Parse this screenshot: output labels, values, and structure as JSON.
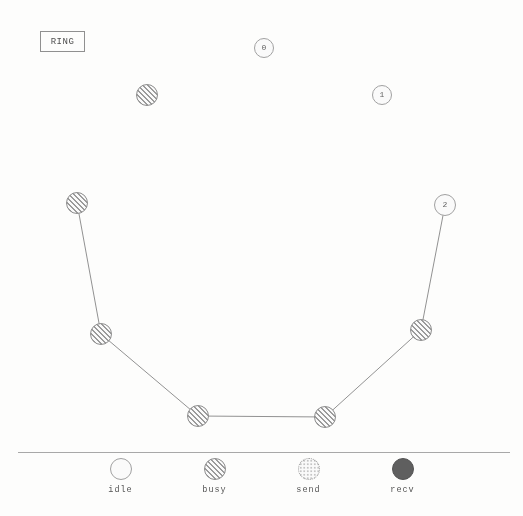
{
  "window": {
    "title_label": "RING",
    "background_color": "#fdfdfc",
    "ink_color": "#5c5c5c"
  },
  "diagram": {
    "edge_color": "#909090",
    "nodes": [
      {
        "id": "n0",
        "label": "0",
        "state": "idle",
        "x": 264,
        "y": 48,
        "r": 10
      },
      {
        "id": "n1",
        "label": "1",
        "state": "idle",
        "x": 382,
        "y": 95,
        "r": 10
      },
      {
        "id": "n2",
        "label": "2",
        "state": "idle",
        "x": 445,
        "y": 205,
        "r": 11
      },
      {
        "id": "n3",
        "label": "",
        "state": "busy",
        "x": 147,
        "y": 95,
        "r": 11
      },
      {
        "id": "n4",
        "label": "",
        "state": "busy",
        "x": 77,
        "y": 203,
        "r": 11
      },
      {
        "id": "n5",
        "label": "",
        "state": "busy",
        "x": 101,
        "y": 334,
        "r": 11
      },
      {
        "id": "n6",
        "label": "",
        "state": "busy",
        "x": 198,
        "y": 416,
        "r": 11
      },
      {
        "id": "n7",
        "label": "",
        "state": "busy",
        "x": 325,
        "y": 417,
        "r": 11
      },
      {
        "id": "n8",
        "label": "",
        "state": "busy",
        "x": 421,
        "y": 330,
        "r": 11
      }
    ],
    "edges": [
      {
        "from": "n4",
        "to": "n5"
      },
      {
        "from": "n5",
        "to": "n6"
      },
      {
        "from": "n6",
        "to": "n7"
      },
      {
        "from": "n7",
        "to": "n8"
      },
      {
        "from": "n8",
        "to": "n2"
      }
    ]
  },
  "separator": {
    "x": 18,
    "y": 452,
    "width": 492
  },
  "legend": {
    "items": [
      {
        "label": "idle",
        "state": "idle"
      },
      {
        "label": "busy",
        "state": "busy"
      },
      {
        "label": "send",
        "state": "send"
      },
      {
        "label": "recv",
        "state": "recv"
      }
    ]
  }
}
